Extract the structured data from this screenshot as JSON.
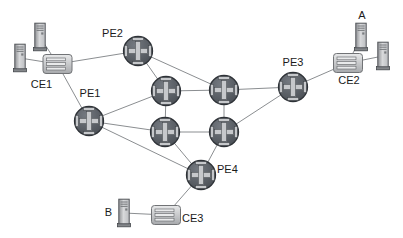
{
  "diagram": {
    "type": "network-topology",
    "labels": {
      "pe1": "PE1",
      "pe2": "PE2",
      "pe3": "PE3",
      "pe4": "PE4",
      "ce1": "CE1",
      "ce2": "CE2",
      "ce3": "CE3",
      "host_a": "A",
      "host_b": "B"
    },
    "nodes": [
      {
        "id": "tower-ce1-top",
        "type": "host-tower",
        "label": ""
      },
      {
        "id": "tower-ce1-left",
        "type": "host-tower",
        "label": ""
      },
      {
        "id": "host-a",
        "type": "host-tower",
        "label": "A"
      },
      {
        "id": "tower-ce2-right",
        "type": "host-tower",
        "label": ""
      },
      {
        "id": "host-b",
        "type": "host-tower",
        "label": "B"
      },
      {
        "id": "ce1",
        "type": "ce-switch",
        "label": "CE1"
      },
      {
        "id": "ce2",
        "type": "ce-switch",
        "label": "CE2"
      },
      {
        "id": "ce3",
        "type": "ce-switch",
        "label": "CE3"
      },
      {
        "id": "pe1",
        "type": "router",
        "label": "PE1"
      },
      {
        "id": "pe2",
        "type": "router",
        "label": "PE2"
      },
      {
        "id": "pe3",
        "type": "router",
        "label": "PE3"
      },
      {
        "id": "pe4",
        "type": "router",
        "label": "PE4"
      },
      {
        "id": "p-core-top-left",
        "type": "router",
        "label": ""
      },
      {
        "id": "p-core-top-right",
        "type": "router",
        "label": ""
      },
      {
        "id": "p-core-bottom-left",
        "type": "router",
        "label": ""
      },
      {
        "id": "p-core-bottom-right",
        "type": "router",
        "label": ""
      }
    ],
    "links": [
      [
        "tower-ce1-top",
        "ce1"
      ],
      [
        "tower-ce1-left",
        "ce1"
      ],
      [
        "ce1",
        "pe2"
      ],
      [
        "ce1",
        "pe1"
      ],
      [
        "pe2",
        "p-core-top-left"
      ],
      [
        "pe2",
        "p-core-top-right"
      ],
      [
        "pe1",
        "p-core-top-left"
      ],
      [
        "pe1",
        "p-core-bottom-left"
      ],
      [
        "pe1",
        "pe4"
      ],
      [
        "p-core-top-left",
        "p-core-top-right"
      ],
      [
        "p-core-top-left",
        "p-core-bottom-left"
      ],
      [
        "p-core-top-right",
        "p-core-bottom-right"
      ],
      [
        "p-core-bottom-left",
        "p-core-bottom-right"
      ],
      [
        "p-core-top-right",
        "pe3"
      ],
      [
        "p-core-bottom-right",
        "pe3"
      ],
      [
        "p-core-bottom-left",
        "pe4"
      ],
      [
        "p-core-bottom-right",
        "pe4"
      ],
      [
        "pe4",
        "ce3"
      ],
      [
        "ce3",
        "host-b"
      ],
      [
        "pe3",
        "ce2"
      ],
      [
        "ce2",
        "host-a"
      ],
      [
        "ce2",
        "tower-ce2-right"
      ]
    ],
    "colors": {
      "background": "#ffffff",
      "link": "#8b8e91",
      "router_fill": "#5a5f66",
      "router_border": "#2e3237",
      "router_cross": "#c6c8cb",
      "switch_fill": "#c9cbce",
      "switch_border": "#717376",
      "switch_bar": "#e9eaeb",
      "tower_fill": "#c4c6c9",
      "tower_border": "#53565a",
      "label_text": "#1b1b1b"
    }
  }
}
